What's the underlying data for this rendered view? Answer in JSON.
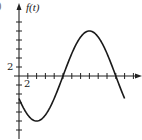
{
  "chart_data": {
    "type": "line",
    "title": "",
    "xlabel": "",
    "ylabel": "f(t)",
    "corner_mark": ")",
    "x_tick_step": 2,
    "y_tick_step": 2,
    "x_tick_label": "2",
    "y_tick_label": "2",
    "xlim": [
      0,
      26
    ],
    "ylim": [
      -12,
      14
    ],
    "grid": false,
    "legend": null,
    "x": [
      0,
      2,
      4,
      6,
      8,
      10,
      12,
      14,
      16,
      18,
      20,
      22,
      24
    ],
    "series": [
      {
        "name": "f(t)",
        "values": [
          -5,
          -8.66,
          -10,
          -8.66,
          -5,
          0,
          5,
          8.66,
          10,
          8.66,
          5,
          0,
          -5
        ]
      }
    ],
    "annotations": [
      "curve approximates f(t) = 10 sin(pi (t - 10) / 12)"
    ],
    "colors": {
      "axis": "#222222",
      "curve": "#1a1a1a"
    }
  }
}
